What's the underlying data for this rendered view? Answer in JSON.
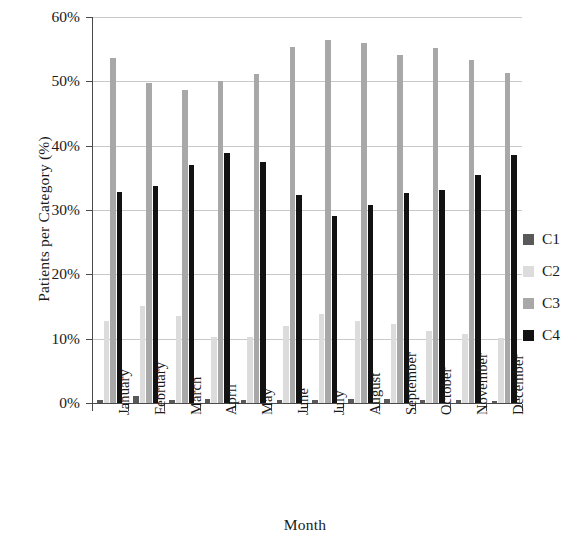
{
  "chart_data": {
    "type": "bar",
    "title": "",
    "xlabel": "Month",
    "ylabel": "Patients per Category (%)",
    "categories": [
      "January",
      "February",
      "March",
      "April",
      "May",
      "June",
      "July",
      "August",
      "September",
      "October",
      "November",
      "December"
    ],
    "ylim": [
      0,
      60
    ],
    "ytick_labels": [
      "0%",
      "10%",
      "20%",
      "30%",
      "40%",
      "50%",
      "60%"
    ],
    "ytick_values": [
      0,
      10,
      20,
      30,
      40,
      50,
      60
    ],
    "grid": true,
    "legend_position": "right",
    "series": [
      {
        "name": "C1",
        "color": "#595959",
        "values": [
          0.4,
          1.1,
          0.4,
          0.6,
          0.4,
          0.4,
          0.5,
          0.7,
          0.7,
          0.4,
          0.4,
          0.3
        ]
      },
      {
        "name": "C2",
        "color": "#dcdcdc",
        "values": [
          12.8,
          15.1,
          13.5,
          10.2,
          10.3,
          11.9,
          13.9,
          12.7,
          12.3,
          11.2,
          10.8,
          10.1
        ]
      },
      {
        "name": "C3",
        "color": "#a8a8a8",
        "values": [
          53.7,
          49.8,
          48.6,
          50.1,
          51.2,
          55.3,
          56.4,
          55.9,
          54.1,
          55.2,
          53.3,
          51.3
        ]
      },
      {
        "name": "C4",
        "color": "#121212",
        "values": [
          32.8,
          33.8,
          37.0,
          38.8,
          37.4,
          32.3,
          29.0,
          30.8,
          32.7,
          33.1,
          35.4,
          38.5
        ]
      }
    ]
  },
  "legend": {
    "items": [
      {
        "label": "C1",
        "color": "#595959"
      },
      {
        "label": "C2",
        "color": "#dcdcdc"
      },
      {
        "label": "C3",
        "color": "#a8a8a8"
      },
      {
        "label": "C4",
        "color": "#121212"
      }
    ]
  }
}
